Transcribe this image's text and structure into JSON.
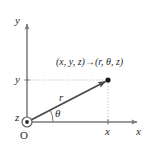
{
  "figure": {
    "name": "cylindrical-coordinates-diagram",
    "colors": {
      "background": "#ffffff",
      "axis": "#7a7a7a",
      "radius_vector": "#4a4a4a",
      "dotted_guide": "#b0b0b0",
      "text": "#2b2b2b",
      "point_fill": "#1a1a1a"
    },
    "axes": {
      "y_label": "y",
      "x_label": "x",
      "z_label": "z",
      "origin_label": "O"
    },
    "ticks": {
      "y_tick_label": "y",
      "x_tick_label": "x"
    },
    "annotations": {
      "radius_label": "r",
      "angle_label": "θ",
      "mapping_rect": "(x, y, z)",
      "mapping_arrow": "→",
      "mapping_cyl": "(r, θ, z)"
    },
    "geometry": {
      "origin": {
        "x": 27,
        "y": 122
      },
      "point": {
        "x": 108,
        "y": 80
      },
      "y_axis_top": {
        "x": 27,
        "y": 22
      },
      "x_axis_right": {
        "x": 140,
        "y": 122
      },
      "z_symbol": "circle-dot-out-of-page",
      "angle_arc_radius": 22,
      "theta_degrees": 27
    }
  }
}
